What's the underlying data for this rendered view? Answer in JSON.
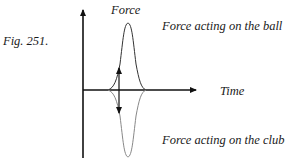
{
  "figure": {
    "caption": "Fig. 251.",
    "y_axis_label": "Force",
    "x_axis_label": "Time",
    "upper_curve_label": "Force acting on the ball",
    "lower_curve_label": "Force acting on the club"
  },
  "colors": {
    "axis": "#111111",
    "upper_curve": "#333333",
    "lower_curve": "#777777"
  }
}
